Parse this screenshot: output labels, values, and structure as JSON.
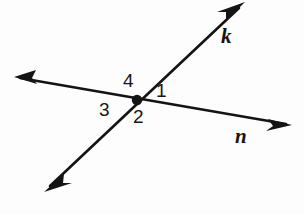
{
  "figure": {
    "type": "intersecting-lines-angle-diagram",
    "background_color": "#fdfdfd",
    "stroke_color": "#141414",
    "width": 304,
    "height": 214,
    "intersection_point": {
      "x": 137,
      "y": 100,
      "dot_radius": 5
    },
    "lines": [
      {
        "name": "k",
        "label": "k",
        "label_position": {
          "x": 221,
          "y": 26
        },
        "from": {
          "x": 44,
          "y": 192
        },
        "to": {
          "x": 245,
          "y": 2
        },
        "arrowheads": "both"
      },
      {
        "name": "n",
        "label": "n",
        "label_position": {
          "x": 235,
          "y": 126
        },
        "from": {
          "x": 14,
          "y": 77
        },
        "to": {
          "x": 292,
          "y": 125
        },
        "arrowheads": "both"
      }
    ],
    "angles": [
      {
        "id": "angle-1",
        "label": "1",
        "position": {
          "x": 156,
          "y": 81
        },
        "region": "right"
      },
      {
        "id": "angle-2",
        "label": "2",
        "position": {
          "x": 133,
          "y": 107
        },
        "region": "bottom"
      },
      {
        "id": "angle-3",
        "label": "3",
        "position": {
          "x": 99,
          "y": 100
        },
        "region": "left"
      },
      {
        "id": "angle-4",
        "label": "4",
        "position": {
          "x": 123,
          "y": 71
        },
        "region": "top"
      }
    ]
  }
}
